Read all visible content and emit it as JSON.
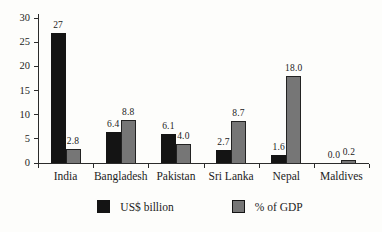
{
  "chart_data": {
    "type": "bar",
    "categories": [
      "India",
      "Bangladesh",
      "Pakistan",
      "Sri Lanka",
      "Nepal",
      "Maldives"
    ],
    "series": [
      {
        "name": "US$ billion",
        "color": "#141414",
        "values": [
          27,
          6.4,
          6.1,
          2.7,
          1.6,
          0.0
        ],
        "labels": [
          "27",
          "6.4",
          "6.1",
          "2.7",
          "1.6",
          "0.0"
        ]
      },
      {
        "name": "% of GDP",
        "color": "#767676",
        "values": [
          2.8,
          8.8,
          4.0,
          8.7,
          18.0,
          0.2
        ],
        "labels": [
          "2.8",
          "8.8",
          "4.0",
          "8.7",
          "18.0",
          "0.2"
        ]
      }
    ],
    "title": "",
    "xlabel": "",
    "ylabel": "",
    "ylim": [
      0,
      30
    ],
    "ytick_step": 5,
    "ytick_labels": [
      "0",
      "5",
      "10",
      "15",
      "20",
      "25",
      "30"
    ],
    "grid": false,
    "legend_position": "bottom"
  },
  "colors": {
    "bar_black": "#141414",
    "bar_gray": "#767676",
    "bar_border": "#222222",
    "axis": "#2b2b2b",
    "text": "#1c1c1c",
    "background": "#fdfdfb"
  }
}
